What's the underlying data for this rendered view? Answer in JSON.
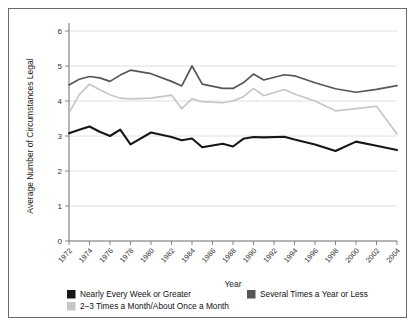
{
  "chart_data": {
    "type": "line",
    "title": "",
    "xlabel": "Year",
    "ylabel": "Average Number of Circumstances Legal",
    "xlim": [
      1972,
      2004
    ],
    "ylim": [
      0,
      6
    ],
    "yticks": [
      0,
      1,
      2,
      3,
      4,
      5,
      6
    ],
    "xticks": [
      1972,
      1974,
      1976,
      1978,
      1980,
      1982,
      1984,
      1986,
      1988,
      1990,
      1992,
      1994,
      1996,
      1998,
      2000,
      2002,
      2004
    ],
    "grid": true,
    "legend_position": "bottom",
    "x": [
      1972,
      1973,
      1974,
      1975,
      1976,
      1977,
      1978,
      1980,
      1982,
      1983,
      1984,
      1985,
      1987,
      1988,
      1989,
      1990,
      1991,
      1993,
      1994,
      1996,
      1998,
      2000,
      2002,
      2004
    ],
    "series": [
      {
        "name": "Nearly Every Week or Greater",
        "color": "#161616",
        "values": [
          3.08,
          3.18,
          3.27,
          3.12,
          3.0,
          3.18,
          2.76,
          3.1,
          2.97,
          2.88,
          2.93,
          2.68,
          2.78,
          2.7,
          2.92,
          2.97,
          2.96,
          2.98,
          2.9,
          2.76,
          2.57,
          2.84,
          2.72,
          2.6
        ]
      },
      {
        "name": "2–3 Times a Month/About Once a Month",
        "color": "#c6c6c6",
        "values": [
          3.66,
          4.18,
          4.48,
          4.32,
          4.18,
          4.08,
          4.06,
          4.08,
          4.17,
          3.78,
          4.06,
          3.98,
          3.95,
          4.0,
          4.12,
          4.36,
          4.15,
          4.33,
          4.2,
          4.0,
          3.72,
          3.78,
          3.85,
          3.06
        ]
      },
      {
        "name": "Several Times a Year or Less",
        "color": "#565656",
        "values": [
          4.46,
          4.62,
          4.7,
          4.66,
          4.56,
          4.74,
          4.88,
          4.78,
          4.56,
          4.43,
          5.0,
          4.48,
          4.36,
          4.36,
          4.52,
          4.77,
          4.6,
          4.75,
          4.72,
          4.52,
          4.35,
          4.25,
          4.33,
          4.44
        ]
      }
    ]
  },
  "legend": {
    "items": [
      {
        "label": "Nearly Every Week or Greater",
        "color": "#161616"
      },
      {
        "label": "Several Times a Year or Less",
        "color": "#565656"
      },
      {
        "label": "2–3 Times a Month/About Once a Month",
        "color": "#c6c6c6"
      }
    ]
  },
  "caption": ""
}
